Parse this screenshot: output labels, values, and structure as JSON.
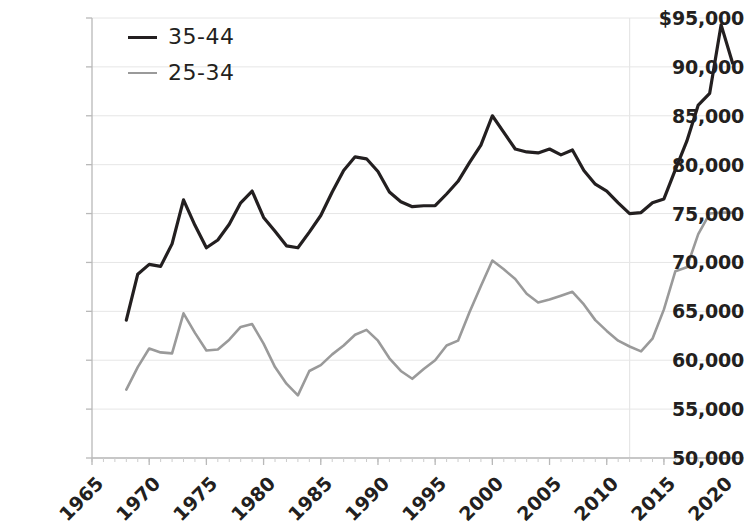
{
  "chart_data": {
    "type": "line",
    "title": "",
    "subtitle": "",
    "xlabel": "",
    "ylabel": "",
    "xlim": [
      1965,
      2022
    ],
    "ylim": [
      50000,
      95000
    ],
    "grid": true,
    "legend_position": "top-left",
    "y_ticks": [
      {
        "value": 95000,
        "label": "$95,000"
      },
      {
        "value": 90000,
        "label": "90,000"
      },
      {
        "value": 85000,
        "label": "85,000"
      },
      {
        "value": 80000,
        "label": "80,000"
      },
      {
        "value": 75000,
        "label": "75,000"
      },
      {
        "value": 70000,
        "label": "70,000"
      },
      {
        "value": 65000,
        "label": "65,000"
      },
      {
        "value": 60000,
        "label": "60,000"
      },
      {
        "value": 55000,
        "label": "55,000"
      },
      {
        "value": 50000,
        "label": "50,000"
      }
    ],
    "x_ticks": [
      {
        "value": 1965,
        "label": "1965"
      },
      {
        "value": 1970,
        "label": "1970"
      },
      {
        "value": 1975,
        "label": "1975"
      },
      {
        "value": 1980,
        "label": "1980"
      },
      {
        "value": 1985,
        "label": "1985"
      },
      {
        "value": 1990,
        "label": "1990"
      },
      {
        "value": 1995,
        "label": "1995"
      },
      {
        "value": 2000,
        "label": "2000"
      },
      {
        "value": 2005,
        "label": "2005"
      },
      {
        "value": 2010,
        "label": "2010"
      },
      {
        "value": 2015,
        "label": "2015"
      },
      {
        "value": 2020,
        "label": "2020"
      }
    ],
    "x_minor_tick_step": 1,
    "vertical_marker_x": 2012,
    "series": [
      {
        "name": "35-44",
        "color": "#231f20",
        "width": 3.2,
        "x": [
          1968,
          1969,
          1970,
          1971,
          1972,
          1973,
          1974,
          1975,
          1976,
          1977,
          1978,
          1979,
          1980,
          1981,
          1982,
          1983,
          1984,
          1985,
          1986,
          1987,
          1988,
          1989,
          1990,
          1991,
          1992,
          1993,
          1994,
          1995,
          1996,
          1997,
          1998,
          1999,
          2000,
          2001,
          2002,
          2003,
          2004,
          2005,
          2006,
          2007,
          2008,
          2009,
          2010,
          2011,
          2012,
          2013,
          2014,
          2015,
          2016,
          2017,
          2018,
          2019,
          2020,
          2021
        ],
        "values": [
          64100,
          68800,
          69800,
          69600,
          71900,
          76400,
          73800,
          71500,
          72300,
          73900,
          76100,
          77300,
          74600,
          73200,
          71700,
          71500,
          73100,
          74800,
          77200,
          79400,
          80800,
          80600,
          79300,
          77200,
          76200,
          75700,
          75800,
          75800,
          77000,
          78300,
          80200,
          82000,
          85000,
          83300,
          81600,
          81300,
          81200,
          81600,
          81000,
          81500,
          79400,
          78000,
          77300,
          76100,
          75000,
          75100,
          76100,
          76500,
          79500,
          82400,
          86100,
          87300,
          94300,
          90400
        ]
      },
      {
        "name": "25-34",
        "color": "#9a9a9a",
        "width": 2.6,
        "x": [
          1968,
          1969,
          1970,
          1971,
          1972,
          1973,
          1974,
          1975,
          1976,
          1977,
          1978,
          1979,
          1980,
          1981,
          1982,
          1983,
          1984,
          1985,
          1986,
          1987,
          1988,
          1989,
          1990,
          1991,
          1992,
          1993,
          1994,
          1995,
          1996,
          1997,
          1998,
          1999,
          2000,
          2001,
          2002,
          2003,
          2004,
          2005,
          2006,
          2007,
          2008,
          2009,
          2010,
          2011,
          2012,
          2013,
          2014,
          2015,
          2016,
          2017,
          2018,
          2019,
          2020,
          2021
        ],
        "values": [
          57000,
          59300,
          61200,
          60800,
          60700,
          64800,
          62800,
          61000,
          61100,
          62100,
          63400,
          63700,
          61700,
          59300,
          57600,
          56400,
          58900,
          59500,
          60600,
          61500,
          62600,
          63100,
          62000,
          60200,
          58900,
          58100,
          59100,
          60000,
          61500,
          62000,
          64900,
          67600,
          70200,
          69300,
          68300,
          66800,
          65900,
          66200,
          66600,
          67000,
          65700,
          64100,
          63000,
          62000,
          61400,
          60900,
          62200,
          65200,
          69100,
          69500,
          72900,
          75000,
          75100,
          75100
        ]
      }
    ]
  },
  "legend": {
    "items": [
      {
        "label": "35-44",
        "color": "#231f20"
      },
      {
        "label": "25-34",
        "color": "#9a9a9a"
      }
    ]
  },
  "axes": {
    "axis_color": "#b9b9b9",
    "grid_color": "#e6e6e6",
    "label_color": "#231f20"
  }
}
